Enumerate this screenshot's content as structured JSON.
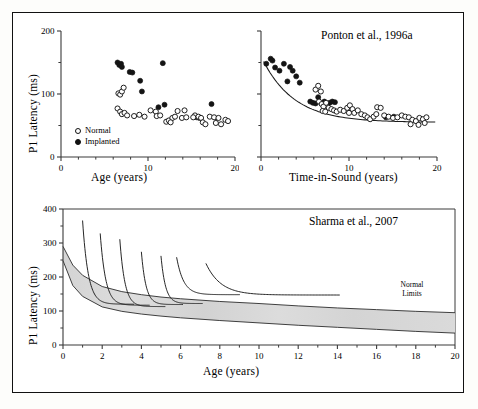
{
  "figure": {
    "background": "#ffffff",
    "border_color": "#111111",
    "axis_color": "#3a3a3a",
    "marker_open_label": "Normal",
    "marker_filled_label": "Implanted",
    "band_fill": "#d9d9d9",
    "band_label_line1": "Normal",
    "band_label_line2": "Limits"
  },
  "chart_data": [
    {
      "id": "panel-top-left",
      "type": "scatter",
      "title": "",
      "xlabel": "Age (years)",
      "ylabel": "P1 Latency (ms)",
      "xlim": [
        0,
        20
      ],
      "ylim": [
        0,
        200
      ],
      "xticks": [
        0,
        10,
        20
      ],
      "xticklabels": [
        "0",
        "10",
        "20"
      ],
      "xminorticks": [
        2,
        4,
        6,
        8,
        12,
        14,
        16,
        18
      ],
      "yticks": [
        0,
        100,
        200
      ],
      "yticklabels": [
        "0",
        "100",
        "200"
      ],
      "yminorticks": [
        50,
        150
      ],
      "grid": false,
      "legend": [
        "Normal",
        "Implanted"
      ],
      "legend_position": "lower-left",
      "series": [
        {
          "name": "Implanted",
          "marker": "filled-circle",
          "points": [
            [
              6.5,
              150
            ],
            [
              6.7,
              146
            ],
            [
              6.9,
              148
            ],
            [
              7.0,
              143
            ],
            [
              7.9,
              135
            ],
            [
              8.2,
              134
            ],
            [
              9.1,
              121
            ],
            [
              9.3,
              104
            ],
            [
              11.7,
              149
            ],
            [
              11.9,
              83
            ],
            [
              11.2,
              79
            ],
            [
              15.6,
              63
            ],
            [
              15.9,
              62
            ],
            [
              17.3,
              84
            ]
          ]
        },
        {
          "name": "Normal",
          "marker": "open-circle",
          "points": [
            [
              6.6,
              101
            ],
            [
              6.8,
              99
            ],
            [
              7.0,
              104
            ],
            [
              7.2,
              110
            ],
            [
              6.5,
              77
            ],
            [
              6.8,
              72
            ],
            [
              7.0,
              68
            ],
            [
              7.3,
              70
            ],
            [
              7.6,
              66
            ],
            [
              8.4,
              65
            ],
            [
              9.0,
              67
            ],
            [
              9.6,
              64
            ],
            [
              10.3,
              74
            ],
            [
              10.9,
              72
            ],
            [
              11.0,
              65
            ],
            [
              11.4,
              66
            ],
            [
              12.1,
              56
            ],
            [
              12.4,
              58
            ],
            [
              12.8,
              62
            ],
            [
              13.1,
              64
            ],
            [
              13.4,
              73
            ],
            [
              14.2,
              74
            ],
            [
              13.9,
              62
            ],
            [
              14.4,
              63
            ],
            [
              15.4,
              66
            ],
            [
              15.8,
              64
            ],
            [
              16.1,
              62
            ],
            [
              16.3,
              55
            ],
            [
              16.6,
              52
            ],
            [
              17.1,
              64
            ],
            [
              17.6,
              63
            ],
            [
              18.1,
              62
            ],
            [
              17.8,
              54
            ],
            [
              18.4,
              52
            ],
            [
              18.9,
              59
            ],
            [
              19.2,
              57
            ],
            [
              15.2,
              63
            ],
            [
              12.6,
              55
            ]
          ]
        }
      ]
    },
    {
      "id": "panel-top-right",
      "type": "scatter",
      "title": "Ponton et al., 1996a",
      "xlabel": "Time-in-Sound (years)",
      "ylabel": "",
      "xlim": [
        0,
        20
      ],
      "ylim": [
        0,
        200
      ],
      "xticks": [
        0,
        10,
        20
      ],
      "xticklabels": [
        "0",
        "10",
        "20"
      ],
      "xminorticks": [
        2,
        4,
        6,
        8,
        12,
        14,
        16,
        18
      ],
      "yticks": [
        0,
        100,
        200
      ],
      "yticklabels": [
        "",
        "",
        ""
      ],
      "yminorticks": [
        50,
        150
      ],
      "grid": false,
      "fit_curve": {
        "name": "exponential-decay-fit",
        "equation_hint": "y = 55 + 105*exp(-x/3.6)",
        "asymptote": 55
      },
      "series": [
        {
          "name": "Implanted",
          "marker": "filled-circle",
          "points": [
            [
              0.6,
              148
            ],
            [
              1.1,
              156
            ],
            [
              1.3,
              153
            ],
            [
              1.6,
              142
            ],
            [
              2.1,
              137
            ],
            [
              2.6,
              148
            ],
            [
              3.0,
              120
            ],
            [
              3.3,
              143
            ],
            [
              3.6,
              137
            ],
            [
              4.0,
              128
            ],
            [
              4.4,
              118
            ],
            [
              5.6,
              88
            ],
            [
              5.9,
              86
            ],
            [
              6.2,
              85
            ],
            [
              6.5,
              95
            ],
            [
              7.2,
              88
            ],
            [
              7.8,
              86
            ],
            [
              8.1,
              88
            ],
            [
              8.4,
              87
            ],
            [
              14.2,
              63
            ],
            [
              15.1,
              64
            ]
          ]
        },
        {
          "name": "Normal",
          "marker": "open-circle",
          "points": [
            [
              6.2,
              107
            ],
            [
              6.5,
              113
            ],
            [
              6.8,
              104
            ],
            [
              6.6,
              88
            ],
            [
              6.9,
              84
            ],
            [
              7.1,
              80
            ],
            [
              7.4,
              86
            ],
            [
              7.0,
              73
            ],
            [
              7.3,
              72
            ],
            [
              7.7,
              78
            ],
            [
              8.0,
              76
            ],
            [
              8.3,
              74
            ],
            [
              8.6,
              72
            ],
            [
              9.0,
              75
            ],
            [
              9.4,
              73
            ],
            [
              9.8,
              78
            ],
            [
              10.1,
              82
            ],
            [
              10.4,
              76
            ],
            [
              10.0,
              70
            ],
            [
              10.6,
              70
            ],
            [
              11.0,
              74
            ],
            [
              11.4,
              68
            ],
            [
              11.8,
              66
            ],
            [
              12.1,
              63
            ],
            [
              12.4,
              60
            ],
            [
              12.8,
              64
            ],
            [
              13.2,
              79
            ],
            [
              13.6,
              78
            ],
            [
              13.1,
              68
            ],
            [
              14.0,
              66
            ],
            [
              14.5,
              64
            ],
            [
              15.0,
              62
            ],
            [
              15.5,
              63
            ],
            [
              16.0,
              66
            ],
            [
              16.4,
              64
            ],
            [
              16.8,
              63
            ],
            [
              17.2,
              59
            ],
            [
              17.6,
              57
            ],
            [
              18.0,
              62
            ],
            [
              18.4,
              60
            ],
            [
              18.8,
              63
            ],
            [
              17.0,
              52
            ],
            [
              17.9,
              51
            ],
            [
              18.6,
              54
            ]
          ]
        }
      ]
    },
    {
      "id": "panel-bottom",
      "type": "line",
      "title": "Sharma et al., 2007",
      "xlabel": "Age (years)",
      "ylabel": "P1 Latency (ms)",
      "xlim": [
        0,
        20
      ],
      "ylim": [
        0,
        400
      ],
      "xticks": [
        0,
        2,
        4,
        6,
        8,
        10,
        12,
        14,
        16,
        18,
        20
      ],
      "xticklabels": [
        "0",
        "2",
        "4",
        "6",
        "8",
        "10",
        "12",
        "14",
        "16",
        "18",
        "20"
      ],
      "xminorticks": [
        1,
        3,
        5,
        7,
        9,
        11,
        13,
        15,
        17,
        19
      ],
      "yticks": [
        0,
        100,
        200,
        300,
        400
      ],
      "yticklabels": [
        "0",
        "100",
        "200",
        "300",
        "400"
      ],
      "yminorticks": [
        50,
        150,
        250,
        350
      ],
      "grid": false,
      "annotation": "Normal Limits",
      "normal_limits_band": {
        "name": "Normal Limits",
        "upper": [
          [
            0,
            290
          ],
          [
            0.5,
            235
          ],
          [
            1,
            205
          ],
          [
            2,
            172
          ],
          [
            3,
            157
          ],
          [
            4,
            148
          ],
          [
            5,
            141
          ],
          [
            6,
            136
          ],
          [
            8,
            128
          ],
          [
            10,
            122
          ],
          [
            12,
            115
          ],
          [
            14,
            109
          ],
          [
            16,
            104
          ],
          [
            18,
            99
          ],
          [
            20,
            95
          ]
        ],
        "lower": [
          [
            0,
            248
          ],
          [
            0.5,
            175
          ],
          [
            1,
            143
          ],
          [
            2,
            112
          ],
          [
            3,
            99
          ],
          [
            4,
            91
          ],
          [
            5,
            85
          ],
          [
            6,
            80
          ],
          [
            8,
            72
          ],
          [
            10,
            65
          ],
          [
            12,
            58
          ],
          [
            14,
            52
          ],
          [
            16,
            46
          ],
          [
            18,
            40
          ],
          [
            20,
            35
          ]
        ]
      },
      "implant_curves": [
        {
          "name": "implant-age-1",
          "onset_age": 1.0,
          "peak": 365,
          "end_age": 3.6,
          "end_value": 120
        },
        {
          "name": "implant-age-2",
          "onset_age": 1.9,
          "peak": 327,
          "end_age": 4.4,
          "end_value": 117
        },
        {
          "name": "implant-age-3",
          "onset_age": 2.9,
          "peak": 310,
          "end_age": 5.2,
          "end_value": 113
        },
        {
          "name": "implant-age-4",
          "onset_age": 4.0,
          "peak": 273,
          "end_age": 6.1,
          "end_value": 119
        },
        {
          "name": "implant-age-5",
          "onset_age": 5.0,
          "peak": 261,
          "end_age": 7.1,
          "end_value": 122
        },
        {
          "name": "implant-age-6",
          "onset_age": 5.8,
          "peak": 257,
          "end_age": 9.0,
          "end_value": 148
        },
        {
          "name": "implant-age-7",
          "onset_age": 7.3,
          "peak": 239,
          "end_age": 14.1,
          "end_value": 147
        }
      ]
    }
  ]
}
